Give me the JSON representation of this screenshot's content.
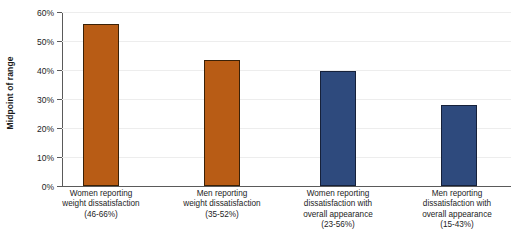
{
  "chart_data": {
    "type": "bar",
    "title": "",
    "xlabel": "",
    "ylabel": "Midpoint of range",
    "ylim": [
      0,
      60
    ],
    "ytick_labels": [
      "60%",
      "50%",
      "40%",
      "30%",
      "20%",
      "10%",
      "0%"
    ],
    "ytick_values": [
      60,
      50,
      40,
      30,
      20,
      10,
      0
    ],
    "grid": true,
    "legend": "none",
    "categories": [
      "Women reporting\nweight dissatisfaction\n(46-66%)",
      "Men reporting\nweight dissatisfaction\n(35-52%)",
      "Women reporting\ndissatisfaction with\noverall appearance\n(23-56%)",
      "Men reporting\ndissatisfaction with\noverall appearance\n(15-43%)"
    ],
    "values": [
      56,
      43.5,
      39.5,
      27.8
    ],
    "bar_colors": [
      "#b85c15",
      "#b85c15",
      "#2e4a7d",
      "#2e4a7d"
    ],
    "ranges": [
      "46-66%",
      "35-52%",
      "23-56%",
      "15-43%"
    ]
  },
  "colors": {
    "orange": "#b85c15",
    "blue": "#2e4a7d",
    "gridline": "#ededed",
    "axis": "#5a5a5a",
    "text": "#1d1d1d",
    "background": "#ffffff"
  }
}
